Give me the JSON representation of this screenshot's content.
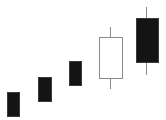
{
  "chart_data": {
    "type": "candlestick",
    "title": "",
    "xlabel": "",
    "ylabel": "",
    "grid": false,
    "legend": null,
    "categories": [
      "1",
      "2",
      "3",
      "4",
      "5"
    ],
    "ylim": [
      0,
      120
    ],
    "y_axis_note": "pixel-space values (higher = up); no axis ticks shown",
    "series": [
      {
        "name": "candle-1",
        "open": 28,
        "close": 4,
        "high": 28,
        "low": 4,
        "color": "bearish",
        "filled": true
      },
      {
        "name": "candle-2",
        "open": 43,
        "close": 19,
        "high": 43,
        "low": 19,
        "color": "bearish",
        "filled": true
      },
      {
        "name": "candle-3",
        "open": 59,
        "close": 35,
        "high": 59,
        "low": 35,
        "color": "bearish",
        "filled": true
      },
      {
        "name": "candle-4",
        "open": 42,
        "close": 83,
        "high": 93,
        "low": 31,
        "color": "bullish",
        "filled": false
      },
      {
        "name": "candle-5",
        "open": 102,
        "close": 58,
        "high": 113,
        "low": 45,
        "color": "bearish",
        "filled": true
      }
    ],
    "geometry": [
      {
        "cx": 13,
        "bodyX": 7,
        "bodyW": 12,
        "bodyTop": 92,
        "bodyBottom": 116,
        "wickTop": 92,
        "wickBottom": 116,
        "filled": true
      },
      {
        "cx": 44,
        "bodyX": 38,
        "bodyW": 13,
        "bodyTop": 77,
        "bodyBottom": 101,
        "wickTop": 77,
        "wickBottom": 101,
        "filled": true
      },
      {
        "cx": 75,
        "bodyX": 69,
        "bodyW": 12,
        "bodyTop": 61,
        "bodyBottom": 85,
        "wickTop": 61,
        "wickBottom": 85,
        "filled": true
      },
      {
        "cx": 110,
        "bodyX": 99,
        "bodyW": 23,
        "bodyTop": 37,
        "bodyBottom": 78,
        "wickTop": 27,
        "wickBottom": 89,
        "filled": false
      },
      {
        "cx": 146,
        "bodyX": 136,
        "bodyW": 22,
        "bodyTop": 18,
        "bodyBottom": 62,
        "wickTop": 7,
        "wickBottom": 75,
        "filled": true
      }
    ],
    "colors": {
      "filled_body": "#141414",
      "hollow_body": "#ffffff",
      "outline": "#8a8a8a",
      "wick": "#8a8a8a"
    }
  }
}
